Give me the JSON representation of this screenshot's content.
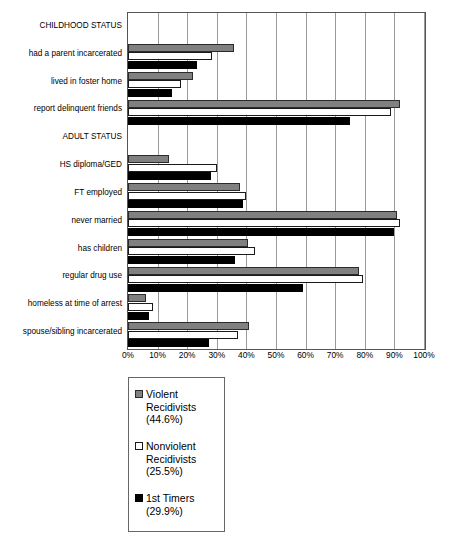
{
  "chart_data": {
    "type": "bar",
    "orientation": "horizontal",
    "title": "",
    "xlabel": "",
    "ylabel": "",
    "xlim": [
      0,
      100
    ],
    "xticks": [
      "0%",
      "10%",
      "20%",
      "30%",
      "40%",
      "50%",
      "60%",
      "70%",
      "80%",
      "90%",
      "100%"
    ],
    "grid": true,
    "legend_position": "below-plot-left",
    "categories": [
      "CHILDHOOD STATUS",
      "had a parent incarcerated",
      "lived in foster home",
      "report delinquent friends",
      "ADULT STATUS",
      "HS diploma/GED",
      "FT employed",
      "never married",
      "has children",
      "regular drug use",
      "homeless at time of arrest",
      "spouse/sibling incarcerated"
    ],
    "section_headers": [
      "CHILDHOOD STATUS",
      "ADULT STATUS"
    ],
    "series": [
      {
        "name": "Violent Recidivists (44.6%)",
        "color": "#808080",
        "values": [
          null,
          35.7,
          22.0,
          92.0,
          null,
          14.0,
          38.0,
          91.0,
          40.5,
          78.0,
          6.0,
          41.0
        ]
      },
      {
        "name": "Nonviolent Recidivists (25.5%)",
        "color": "#ffffff",
        "values": [
          null,
          28.3,
          18.0,
          89.0,
          null,
          30.0,
          40.0,
          92.0,
          43.0,
          79.5,
          8.5,
          37.0
        ]
      },
      {
        "name": "1st Timers (29.9%)",
        "color": "#000000",
        "values": [
          null,
          23.3,
          15.0,
          75.0,
          null,
          28.0,
          39.0,
          90.0,
          36.0,
          59.0,
          7.0,
          27.5
        ]
      }
    ]
  },
  "legend": {
    "entries": [
      {
        "label": "Violent\nRecidivists\n(44.6%)",
        "swatch": "violent"
      },
      {
        "label": "Nonviolent\nRecidivists\n(25.5%)",
        "swatch": "nonviolent"
      },
      {
        "label": "1st Timers\n(29.9%)",
        "swatch": "firsttimer"
      }
    ]
  }
}
